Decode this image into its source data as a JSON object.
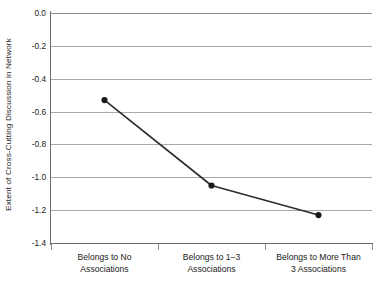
{
  "chart_data": {
    "type": "line",
    "title": "",
    "subtitle": "",
    "xlabel": "",
    "ylabel": "Extent of Cross-Cutting Discussion in Network",
    "categories": [
      "Belongs to No Associations",
      "Belongs to 1–3 Associations",
      "Belongs to More Than 3 Associations"
    ],
    "category_lines": [
      [
        "Belongs to No",
        "Associations"
      ],
      [
        "Belongs to 1–3",
        "Associations"
      ],
      [
        "Belongs to More Than",
        "3 Associations"
      ]
    ],
    "values": [
      -0.53,
      -1.05,
      -1.23
    ],
    "series": [
      {
        "name": "Extent of Cross-Cutting Discussion in Network",
        "values": [
          -0.53,
          -1.05,
          -1.23
        ]
      }
    ],
    "ylim": [
      -1.4,
      0.0
    ],
    "ytick_values": [
      0.0,
      -0.2,
      -0.4,
      -0.6,
      -0.8,
      -1.0,
      -1.2,
      -1.4
    ],
    "ytick_labels": [
      "0.0",
      "-0.2",
      "-0.4",
      "-0.6",
      "-0.8",
      "-1.0",
      "-1.2",
      "-1.4"
    ],
    "grid": true,
    "grid_axis": "y",
    "legend": false,
    "legend_position": "none",
    "marker": "circle",
    "colors": {
      "line": "#2b2b2b",
      "marker": "#1a1a1a",
      "gridline": "#a9a9a9",
      "axis": "#6e6e6e",
      "text": "#1a1a1a",
      "background": "#ffffff"
    }
  },
  "figure": {
    "clipped_caption": ""
  }
}
